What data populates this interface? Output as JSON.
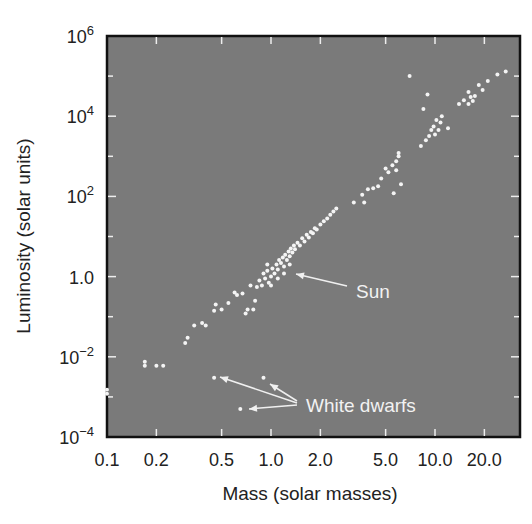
{
  "chart_data": {
    "type": "scatter",
    "title": "",
    "xlabel": "Mass (solar masses)",
    "ylabel": "Luminosity (solar units)",
    "xscale": "log",
    "yscale": "log",
    "xlim": [
      0.1,
      30
    ],
    "ylim": [
      0.0001,
      1000000
    ],
    "grid": false,
    "legend": null,
    "background_color": "#7a7a7a",
    "point_color": "#f4f4f4",
    "x_ticks": [
      {
        "value": 0.1,
        "label": "0.1"
      },
      {
        "value": 0.2,
        "label": "0.2"
      },
      {
        "value": 0.5,
        "label": "0.5"
      },
      {
        "value": 1.0,
        "label": "1.0"
      },
      {
        "value": 2.0,
        "label": "2.0"
      },
      {
        "value": 5.0,
        "label": "5.0"
      },
      {
        "value": 10.0,
        "label": "10.0"
      },
      {
        "value": 20.0,
        "label": "20.0"
      }
    ],
    "y_ticks": [
      {
        "value": 1000000,
        "base": "10",
        "exp": "6"
      },
      {
        "value": 10000,
        "base": "10",
        "exp": "4"
      },
      {
        "value": 100,
        "base": "10",
        "exp": "2"
      },
      {
        "value": 1,
        "base": "1.0",
        "exp": ""
      },
      {
        "value": 0.01,
        "base": "10",
        "exp": "−2"
      },
      {
        "value": 0.0001,
        "base": "10",
        "exp": "−4"
      }
    ],
    "annotations": [
      {
        "text": "Sun",
        "x": 1.0,
        "y": 1.0,
        "label_px": [
          356,
          298
        ]
      },
      {
        "text": "White dwarfs",
        "targets": [
          [
            0.45,
            0.003
          ],
          [
            0.9,
            0.003
          ],
          [
            0.65,
            0.0005
          ]
        ],
        "label_px": [
          306,
          412
        ]
      }
    ],
    "series": [
      {
        "name": "Main sequence stars",
        "points": [
          [
            0.1,
            0.0012
          ],
          [
            0.1,
            0.0015
          ],
          [
            0.17,
            0.006
          ],
          [
            0.17,
            0.0075
          ],
          [
            0.2,
            0.006
          ],
          [
            0.22,
            0.006
          ],
          [
            0.3,
            0.022
          ],
          [
            0.31,
            0.03
          ],
          [
            0.34,
            0.06
          ],
          [
            0.38,
            0.07
          ],
          [
            0.4,
            0.06
          ],
          [
            0.45,
            0.14
          ],
          [
            0.46,
            0.2
          ],
          [
            0.5,
            0.15
          ],
          [
            0.55,
            0.22
          ],
          [
            0.6,
            0.4
          ],
          [
            0.62,
            0.35
          ],
          [
            0.67,
            0.38
          ],
          [
            0.7,
            0.12
          ],
          [
            0.72,
            0.15
          ],
          [
            0.78,
            0.15
          ],
          [
            0.8,
            0.25
          ],
          [
            0.75,
            0.6
          ],
          [
            0.82,
            0.55
          ],
          [
            0.85,
            0.8
          ],
          [
            0.88,
            0.6
          ],
          [
            0.9,
            1.2
          ],
          [
            0.92,
            0.9
          ],
          [
            0.95,
            1.4
          ],
          [
            0.97,
            0.7
          ],
          [
            1.0,
            1.0
          ],
          [
            1.02,
            1.6
          ],
          [
            1.05,
            1.2
          ],
          [
            1.08,
            2.0
          ],
          [
            1.1,
            1.5
          ],
          [
            1.12,
            2.6
          ],
          [
            1.15,
            2.2
          ],
          [
            1.18,
            3.0
          ],
          [
            1.2,
            1.8
          ],
          [
            1.22,
            3.5
          ],
          [
            1.25,
            2.6
          ],
          [
            1.28,
            4.2
          ],
          [
            1.3,
            3.2
          ],
          [
            1.32,
            5.0
          ],
          [
            1.35,
            4.0
          ],
          [
            1.38,
            6.0
          ],
          [
            1.4,
            4.8
          ],
          [
            1.45,
            7.0
          ],
          [
            1.5,
            6.0
          ],
          [
            1.55,
            9.0
          ],
          [
            1.6,
            7.5
          ],
          [
            1.65,
            11
          ],
          [
            1.7,
            9.5
          ],
          [
            1.75,
            13
          ],
          [
            1.8,
            12
          ],
          [
            1.85,
            16
          ],
          [
            1.9,
            15
          ],
          [
            2.0,
            20
          ],
          [
            2.1,
            24
          ],
          [
            2.2,
            28
          ],
          [
            2.3,
            35
          ],
          [
            2.4,
            42
          ],
          [
            2.5,
            50
          ],
          [
            1.0,
            0.6
          ],
          [
            1.1,
            0.9
          ],
          [
            1.2,
            1.2
          ],
          [
            1.3,
            2.0
          ],
          [
            0.95,
            2.0
          ],
          [
            3.2,
            70
          ],
          [
            3.6,
            110
          ],
          [
            3.7,
            70
          ],
          [
            3.9,
            150
          ],
          [
            4.2,
            160
          ],
          [
            4.5,
            180
          ],
          [
            4.7,
            280
          ],
          [
            5.0,
            500
          ],
          [
            5.2,
            400
          ],
          [
            5.5,
            600
          ],
          [
            5.8,
            450
          ],
          [
            5.8,
            750
          ],
          [
            6.0,
            1000
          ],
          [
            6.0,
            1200
          ],
          [
            5.6,
            120
          ],
          [
            6.2,
            200
          ],
          [
            8.2,
            1800
          ],
          [
            8.8,
            2500
          ],
          [
            9.2,
            3200
          ],
          [
            9.5,
            4500
          ],
          [
            9.8,
            5500
          ],
          [
            10.0,
            3500
          ],
          [
            10.5,
            4500
          ],
          [
            10.2,
            8000
          ],
          [
            10.8,
            7000
          ],
          [
            11.0,
            10000
          ],
          [
            8.5,
            15000
          ],
          [
            9.0,
            35000
          ],
          [
            12.0,
            5000
          ],
          [
            14.0,
            20000
          ],
          [
            15.0,
            25000
          ],
          [
            16.0,
            20000
          ],
          [
            16.5,
            30000
          ],
          [
            17.0,
            24000
          ],
          [
            17.5,
            32000
          ],
          [
            16.0,
            40000
          ],
          [
            18.5,
            60000
          ],
          [
            19.5,
            45000
          ],
          [
            21.0,
            75000
          ],
          [
            24.0,
            110000
          ],
          [
            27.0,
            130000
          ],
          [
            7.0,
            100000
          ]
        ]
      },
      {
        "name": "White dwarfs",
        "points": [
          [
            0.45,
            0.003
          ],
          [
            0.9,
            0.003
          ],
          [
            0.65,
            0.0005
          ]
        ]
      }
    ]
  }
}
